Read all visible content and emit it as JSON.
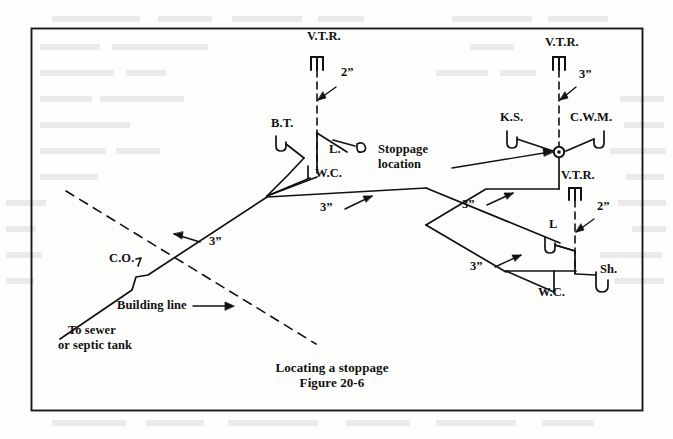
{
  "document": {
    "figure_caption_line1": "Locating a stoppage",
    "figure_caption_line2": "Figure 20-6",
    "border_color": "#1a1a1a",
    "line_color": "#111111",
    "page_background": "#fdfdfc"
  },
  "diagram": {
    "type": "plumbing-isometric-drain-waste-vent",
    "title": "Locating a stoppage",
    "figure_number": "Figure 20-6",
    "stoppage_marker": {
      "label_line1": "Stoppage",
      "label_line2": "location",
      "x": 559,
      "y": 152,
      "symbol": "circle-with-dot"
    },
    "labels": [
      {
        "id": "vtr-left",
        "text": "V.T.R.",
        "x": 307,
        "y": 35,
        "size": "md",
        "note": "vent through roof, left stack"
      },
      {
        "id": "size-2-left",
        "text": "2”",
        "x": 341,
        "y": 72,
        "size": "md",
        "note": "2 inch vent pipe"
      },
      {
        "id": "bt",
        "text": "B.T.",
        "x": 271,
        "y": 122,
        "size": "md",
        "note": "bath tub"
      },
      {
        "id": "l-left",
        "text": "L.",
        "x": 329,
        "y": 148,
        "size": "md",
        "note": "lavatory"
      },
      {
        "id": "wc-left",
        "text": "W.C.",
        "x": 315,
        "y": 172,
        "size": "md",
        "note": "water closet"
      },
      {
        "id": "size-3-mid",
        "text": "3”",
        "x": 320,
        "y": 206,
        "size": "md",
        "note": "3 inch branch drain"
      },
      {
        "id": "vtr-right",
        "text": "V.T.R.",
        "x": 545,
        "y": 41,
        "size": "md",
        "note": "vent through roof, right stack"
      },
      {
        "id": "size-3-right",
        "text": "3”",
        "x": 579,
        "y": 73,
        "size": "md",
        "note": "3 inch vent stack"
      },
      {
        "id": "ks",
        "text": "K.S.",
        "x": 506,
        "y": 116,
        "size": "md",
        "note": "kitchen sink"
      },
      {
        "id": "cwm",
        "text": "C.W.M.",
        "x": 574,
        "y": 116,
        "size": "md",
        "note": "clothes washing machine"
      },
      {
        "id": "stoppage-1",
        "text": "Stoppage",
        "x": 455,
        "y": 148,
        "size": "md",
        "note": "callout line 1"
      },
      {
        "id": "stoppage-2",
        "text": "location",
        "x": 455,
        "y": 163,
        "size": "md",
        "note": "callout line 2"
      },
      {
        "id": "vtr-lower",
        "text": "V.T.R.",
        "x": 561,
        "y": 174,
        "size": "md",
        "note": "vent through roof, lower stack"
      },
      {
        "id": "size-2-lower",
        "text": "2”",
        "x": 597,
        "y": 206,
        "size": "md",
        "note": "2 inch vent pipe"
      },
      {
        "id": "size-3-upperarm",
        "text": "3”",
        "x": 462,
        "y": 203,
        "size": "md",
        "note": "3 inch branch drain"
      },
      {
        "id": "l-lower",
        "text": "L",
        "x": 549,
        "y": 223,
        "size": "md",
        "note": "lavatory"
      },
      {
        "id": "size-3-lowerarm",
        "text": "3”",
        "x": 470,
        "y": 265,
        "size": "md",
        "note": "3 inch branch drain"
      },
      {
        "id": "sh",
        "text": "Sh.",
        "x": 600,
        "y": 268,
        "size": "md",
        "note": "shower"
      },
      {
        "id": "wc-right",
        "text": "W.C.",
        "x": 538,
        "y": 291,
        "size": "md",
        "note": "water closet"
      },
      {
        "id": "size-3-house",
        "text": "3”",
        "x": 209,
        "y": 240,
        "size": "md",
        "note": "3 inch house drain"
      },
      {
        "id": "co",
        "text": "C.O.",
        "x": 109,
        "y": 257,
        "size": "md",
        "note": "cleanout"
      },
      {
        "id": "building-line",
        "text": "Building line",
        "x": 117,
        "y": 304,
        "size": "md",
        "note": "property/building line"
      },
      {
        "id": "to-sewer-1",
        "text": "To sewer",
        "x": 68,
        "y": 329,
        "size": "md",
        "note": "sewer direction line 1"
      },
      {
        "id": "to-sewer-2",
        "text": "or septic tank",
        "x": 58,
        "y": 344,
        "size": "md",
        "note": "sewer direction line 2"
      }
    ],
    "legend_keys": [
      {
        "abbr": "V.T.R.",
        "meaning": "Vent Through Roof"
      },
      {
        "abbr": "B.T.",
        "meaning": "Bath Tub"
      },
      {
        "abbr": "L.",
        "meaning": "Lavatory"
      },
      {
        "abbr": "W.C.",
        "meaning": "Water Closet"
      },
      {
        "abbr": "K.S.",
        "meaning": "Kitchen Sink"
      },
      {
        "abbr": "C.W.M.",
        "meaning": "Clothes Washing Machine"
      },
      {
        "abbr": "Sh.",
        "meaning": "Shower"
      },
      {
        "abbr": "C.O.",
        "meaning": "Cleanout"
      }
    ],
    "pipe_sizes": [
      "2”",
      "3”"
    ]
  }
}
